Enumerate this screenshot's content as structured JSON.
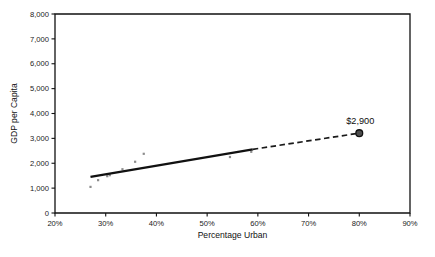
{
  "chart_data": {
    "type": "scatter",
    "title": "",
    "xlabel": "Percentage Urban",
    "ylabel": "GDP per Capita",
    "xlim": [
      20,
      90
    ],
    "ylim": [
      0,
      8000
    ],
    "grid": false,
    "legend": "none",
    "x_tick_labels": [
      "20%",
      "30%",
      "40%",
      "50%",
      "60%",
      "70%",
      "80%",
      "90%"
    ],
    "x_tick_values": [
      20,
      30,
      40,
      50,
      60,
      70,
      80,
      90
    ],
    "y_tick_labels": [
      "0",
      "1,000",
      "2,000",
      "3,000",
      "4,000",
      "5,000",
      "6,000",
      "7,000",
      "8,000"
    ],
    "y_tick_values": [
      0,
      1000,
      2000,
      3000,
      4000,
      5000,
      6000,
      7000,
      8000
    ],
    "series": [
      {
        "name": "Observed countries",
        "type": "scatter",
        "marker": "small-square",
        "color": "#8c8c8c",
        "points": [
          {
            "x": 27.0,
            "y": 1050
          },
          {
            "x": 28.5,
            "y": 1320
          },
          {
            "x": 30.3,
            "y": 1480
          },
          {
            "x": 30.8,
            "y": 1520
          },
          {
            "x": 33.3,
            "y": 1760
          },
          {
            "x": 35.8,
            "y": 2060
          },
          {
            "x": 37.5,
            "y": 2380
          },
          {
            "x": 54.5,
            "y": 2250
          },
          {
            "x": 58.7,
            "y": 2460
          }
        ]
      },
      {
        "name": "Fitted trend (observed range)",
        "type": "line",
        "style": "solid",
        "color": "#111111",
        "points": [
          {
            "x": 27.0,
            "y": 1450
          },
          {
            "x": 59.0,
            "y": 2560
          }
        ]
      },
      {
        "name": "Projected trend",
        "type": "line",
        "style": "dashed",
        "color": "#1a1a1a",
        "points": [
          {
            "x": 59.0,
            "y": 2560
          },
          {
            "x": 80.0,
            "y": 3210
          }
        ]
      },
      {
        "name": "Projected value",
        "type": "scatter",
        "marker": "large-circle",
        "color": "#4d4d4d",
        "edge_color": "#111111",
        "points": [
          {
            "x": 80.0,
            "y": 3210,
            "label": "$2,900"
          }
        ]
      }
    ],
    "annotations": [
      {
        "text": "$2,900",
        "x": 80.0,
        "y": 3210,
        "position": "above"
      }
    ]
  },
  "axes": {
    "y_title": "GDP per Capita",
    "x_title": "Percentage Urban"
  }
}
